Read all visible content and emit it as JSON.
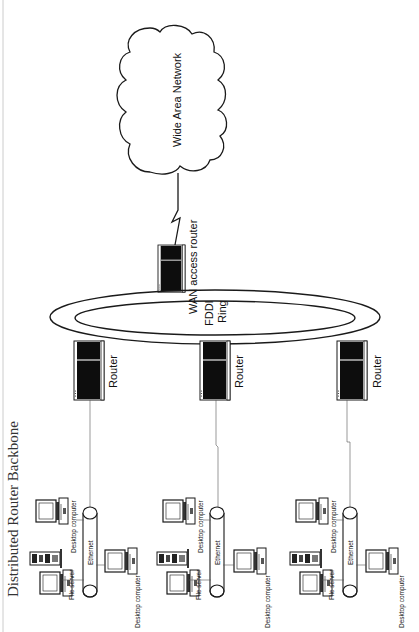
{
  "title": "Distributed Router Backbone",
  "wan": {
    "cloud_label": "Wide Area Network",
    "router_label": "WAN access router"
  },
  "ring": {
    "label_line1": "FDDI",
    "label_line2": "Ring"
  },
  "routers": [
    {
      "label": "Router"
    },
    {
      "label": "Router"
    },
    {
      "label": "Router"
    }
  ],
  "lans": [
    {
      "ethernet_label": "Ethernet",
      "file_server_label": "File server",
      "desktop_top_label": "Desktop computer",
      "desktop_bottom_label": "Desktop computer"
    },
    {
      "ethernet_label": "Ethernet",
      "file_server_label": "File server",
      "desktop_top_label": "Desktop computer",
      "desktop_bottom_label": "Desktop computer"
    },
    {
      "ethernet_label": "Ethernet",
      "file_server_label": "File server",
      "desktop_top_label": "Desktop computer",
      "desktop_bottom_label": "Desktop computer"
    }
  ],
  "colors": {
    "ink": "#1a1a1a",
    "device_fill": "#0d0d0d",
    "background": "#ffffff"
  }
}
